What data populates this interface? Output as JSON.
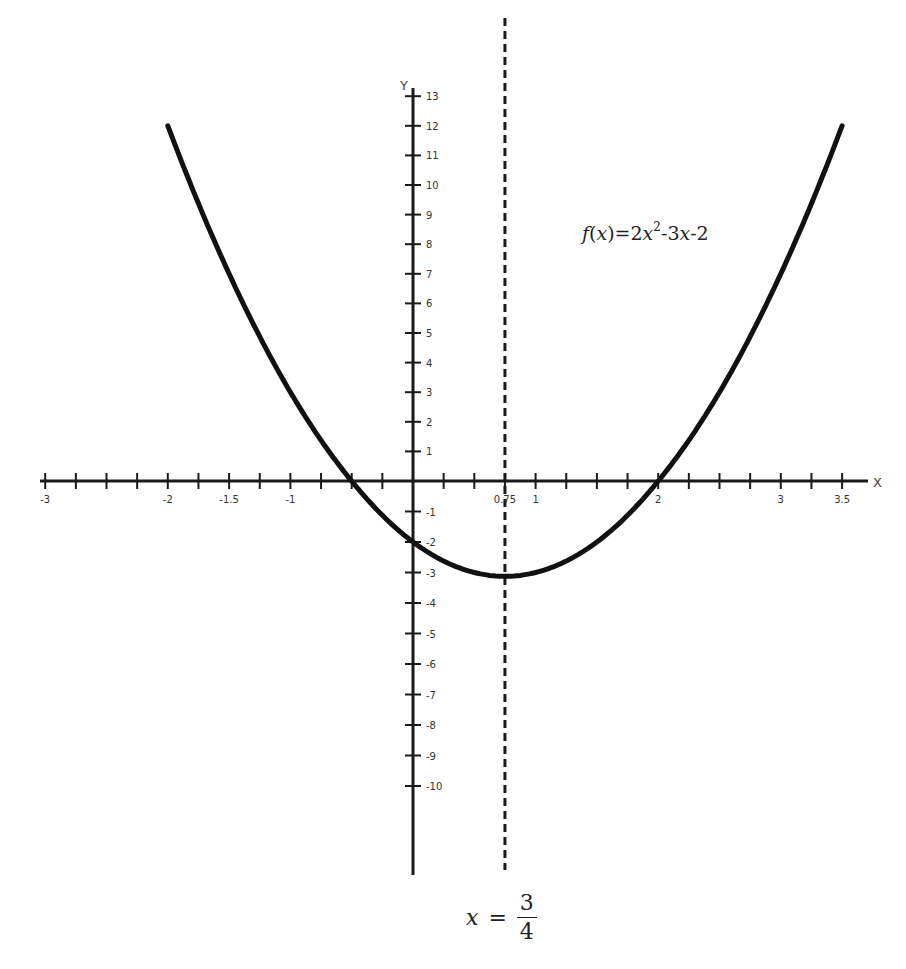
{
  "chart_data": {
    "type": "line",
    "title": "",
    "function": "f(x)=2x^2-3x-2",
    "xlabel": "X",
    "ylabel": "Y",
    "xlim": [
      -3,
      3.5
    ],
    "ylim": [
      -13,
      13
    ],
    "x_tick_labels": [
      {
        "value": -3,
        "label": "-3"
      },
      {
        "value": -2,
        "label": "-2"
      },
      {
        "value": -1.5,
        "label": "-1.5"
      },
      {
        "value": -1,
        "label": "-1"
      },
      {
        "value": 0.75,
        "label": "0.75"
      },
      {
        "value": 1,
        "label": "1"
      },
      {
        "value": 2,
        "label": "2"
      },
      {
        "value": 3,
        "label": "3"
      },
      {
        "value": 3.5,
        "label": "3.5"
      }
    ],
    "x_minor_tick_step": 0.25,
    "y_tick_labels": [
      13,
      12,
      11,
      10,
      9,
      8,
      7,
      6,
      5,
      4,
      3,
      2,
      1,
      -1,
      -2,
      -3,
      -4,
      -5,
      -6,
      -7,
      -8,
      -9,
      -10
    ],
    "grid": false,
    "series": [
      {
        "name": "f(x)=2x^2-3x-2",
        "style": "solid-thick",
        "x": [
          -2,
          -1.5,
          -1,
          -0.5,
          0,
          0.5,
          0.75,
          1,
          1.5,
          2,
          2.5,
          3,
          3.5
        ],
        "y": [
          12,
          7,
          3,
          0,
          -2,
          -3,
          -3.125,
          -3,
          -2,
          0,
          3,
          7,
          12
        ]
      }
    ],
    "annotations": {
      "axis_of_symmetry": {
        "x": 0.75,
        "style": "dashed",
        "label": "x = 3/4"
      },
      "roots": [
        -0.5,
        2
      ],
      "y_intercept": -2,
      "vertex": {
        "x": 0.75,
        "y": -3.125
      }
    }
  },
  "formula": {
    "f": "f",
    "open": "(",
    "x": "x",
    "close": ")=2",
    "x2": "x",
    "exp": "2",
    "rest": "-3",
    "x3": "x",
    "tail": "-2"
  },
  "axis_of_symmetry_label": {
    "var": "x",
    "eq": "=",
    "numerator": "3",
    "denominator": "4"
  }
}
